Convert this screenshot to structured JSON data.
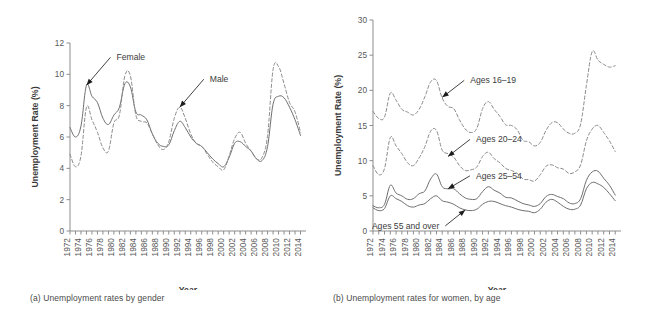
{
  "figure": {
    "panels": [
      {
        "id": "a",
        "caption": "(a) Unemployment rates by gender",
        "xlabel": "Year",
        "ylabel": "Unemployment Rate (%)"
      },
      {
        "id": "b",
        "caption": "(b) Unemployment rates for women, by age",
        "xlabel": "Year",
        "ylabel": "Unemployment Rate (%)"
      }
    ]
  },
  "chart_data": [
    {
      "type": "line",
      "title": "(a) Unemployment rates by gender",
      "xlabel": "Year",
      "ylabel": "Unemployment Rate (%)",
      "xlim": [
        1972,
        2015
      ],
      "ylim": [
        0,
        12
      ],
      "yticks": [
        0,
        2,
        4,
        6,
        8,
        10,
        12
      ],
      "xticks": [
        1972,
        1974,
        1976,
        1978,
        1980,
        1982,
        1984,
        1986,
        1988,
        1990,
        1992,
        1994,
        1996,
        1998,
        2000,
        2002,
        2004,
        2006,
        2008,
        2010,
        2012,
        2014
      ],
      "grid": false,
      "legend": "annotations",
      "annotations": [
        {
          "label": "Female",
          "series": "Female",
          "year": 1975,
          "value": 9.3
        },
        {
          "label": "Male",
          "series": "Male",
          "year": 1992,
          "value": 7.9
        }
      ],
      "x": [
        1972,
        1973,
        1974,
        1975,
        1976,
        1977,
        1978,
        1979,
        1980,
        1981,
        1982,
        1983,
        1984,
        1985,
        1986,
        1987,
        1988,
        1989,
        1990,
        1991,
        1992,
        1993,
        1994,
        1995,
        1996,
        1997,
        1998,
        1999,
        2000,
        2001,
        2002,
        2003,
        2004,
        2005,
        2006,
        2007,
        2008,
        2009,
        2010,
        2011,
        2012,
        2013,
        2014
      ],
      "series": [
        {
          "name": "Female",
          "style": "solid",
          "values": [
            6.6,
            6.0,
            6.7,
            9.3,
            8.6,
            8.2,
            7.2,
            6.8,
            7.4,
            7.9,
            9.4,
            9.2,
            7.6,
            7.4,
            7.1,
            6.2,
            5.6,
            5.4,
            5.5,
            6.4,
            7.0,
            6.6,
            6.0,
            5.6,
            5.4,
            5.0,
            4.6,
            4.3,
            4.1,
            4.7,
            5.6,
            5.7,
            5.4,
            5.1,
            4.6,
            4.5,
            5.4,
            8.1,
            8.6,
            8.5,
            7.9,
            7.1,
            6.1
          ]
        },
        {
          "name": "Male",
          "style": "dashed",
          "values": [
            4.9,
            4.1,
            4.8,
            7.9,
            7.1,
            6.3,
            5.3,
            5.1,
            6.9,
            7.4,
            9.9,
            9.9,
            7.4,
            7.0,
            6.9,
            6.2,
            5.5,
            5.2,
            5.7,
            7.2,
            7.9,
            7.2,
            6.2,
            5.6,
            5.4,
            4.9,
            4.4,
            4.1,
            3.9,
            4.8,
            5.9,
            6.3,
            5.6,
            5.1,
            4.6,
            4.7,
            6.1,
            10.3,
            10.5,
            9.4,
            8.2,
            7.6,
            6.3
          ]
        }
      ]
    },
    {
      "type": "line",
      "title": "(b) Unemployment rates for women, by age",
      "xlabel": "Year",
      "ylabel": "Unemployment Rate (%)",
      "xlim": [
        1972,
        2015
      ],
      "ylim": [
        0,
        30
      ],
      "yticks": [
        0,
        5,
        10,
        15,
        20,
        25,
        30
      ],
      "xticks": [
        1972,
        1974,
        1976,
        1978,
        1980,
        1982,
        1984,
        1986,
        1988,
        1990,
        1992,
        1994,
        1996,
        1998,
        2000,
        2002,
        2004,
        2006,
        2008,
        2010,
        2012,
        2014
      ],
      "grid": false,
      "legend": "annotations",
      "annotations": [
        {
          "label": "Ages 16–19",
          "series": "Ages 16-19",
          "year": 1984,
          "value": 19.0
        },
        {
          "label": "Ages 20–24",
          "series": "Ages 20-24",
          "year": 1985,
          "value": 10.6
        },
        {
          "label": "Ages 25–54",
          "series": "Ages 25-54",
          "year": 1985,
          "value": 6.0
        },
        {
          "label": "Ages 55 and over",
          "series": "Ages 55 and over",
          "year": 1988,
          "value": 3.0
        }
      ],
      "x": [
        1972,
        1973,
        1974,
        1975,
        1976,
        1977,
        1978,
        1979,
        1980,
        1981,
        1982,
        1983,
        1984,
        1985,
        1986,
        1987,
        1988,
        1989,
        1990,
        1991,
        1992,
        1993,
        1994,
        1995,
        1996,
        1997,
        1998,
        1999,
        2000,
        2001,
        2002,
        2003,
        2004,
        2005,
        2006,
        2007,
        2008,
        2009,
        2010,
        2011,
        2012,
        2013,
        2014
      ],
      "series": [
        {
          "name": "Ages 16-19",
          "style": "dashed",
          "values": [
            17.0,
            16.0,
            16.2,
            19.6,
            18.6,
            17.3,
            16.9,
            16.5,
            17.3,
            19.1,
            21.2,
            21.4,
            18.9,
            17.7,
            17.4,
            15.8,
            14.5,
            14.0,
            14.6,
            17.4,
            18.4,
            17.3,
            16.3,
            15.1,
            15.0,
            14.4,
            12.9,
            12.7,
            12.1,
            12.6,
            14.3,
            15.4,
            15.4,
            14.5,
            13.9,
            13.9,
            15.2,
            20.7,
            25.5,
            24.3,
            23.7,
            23.3,
            23.5
          ]
        },
        {
          "name": "Ages 20-24",
          "style": "dashed",
          "values": [
            9.3,
            8.0,
            8.9,
            13.3,
            12.1,
            11.0,
            9.7,
            9.3,
            10.4,
            12.0,
            14.2,
            14.3,
            11.5,
            11.0,
            10.5,
            9.3,
            8.6,
            8.7,
            9.1,
            10.6,
            11.2,
            10.3,
            9.7,
            8.9,
            8.6,
            8.2,
            7.4,
            7.3,
            7.1,
            8.0,
            9.2,
            9.4,
            9.0,
            8.8,
            8.2,
            8.4,
            9.4,
            12.8,
            14.5,
            15.0,
            14.0,
            12.8,
            11.3
          ]
        },
        {
          "name": "Ages 25-54",
          "style": "solid",
          "values": [
            3.6,
            3.3,
            3.8,
            6.5,
            5.4,
            5.0,
            4.5,
            4.6,
            5.3,
            5.7,
            7.4,
            8.1,
            6.3,
            6.0,
            6.0,
            5.3,
            4.7,
            4.5,
            4.6,
            5.6,
            6.3,
            5.8,
            5.4,
            4.8,
            4.7,
            4.3,
            3.9,
            3.7,
            3.5,
            3.9,
            4.9,
            5.2,
            4.9,
            4.6,
            4.0,
            3.9,
            4.6,
            7.2,
            8.4,
            8.5,
            7.5,
            6.5,
            5.1
          ]
        },
        {
          "name": "Ages 55 and over",
          "style": "solid",
          "values": [
            3.3,
            2.9,
            3.2,
            5.0,
            4.6,
            4.2,
            3.6,
            3.4,
            3.7,
            3.9,
            4.6,
            5.0,
            4.3,
            4.1,
            3.8,
            3.3,
            3.0,
            2.9,
            3.1,
            3.8,
            4.2,
            4.2,
            3.9,
            3.6,
            3.4,
            3.1,
            2.9,
            2.8,
            2.6,
            3.1,
            4.1,
            4.5,
            4.1,
            3.5,
            3.1,
            3.1,
            3.7,
            6.0,
            6.9,
            6.7,
            6.2,
            5.3,
            4.3
          ]
        }
      ]
    }
  ]
}
